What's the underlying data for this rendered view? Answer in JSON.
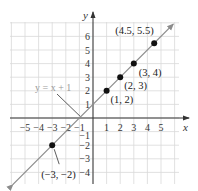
{
  "chart_data": {
    "type": "line",
    "title": "",
    "xlabel": "x",
    "ylabel": "y",
    "xlim": [
      -6,
      6.3
    ],
    "ylim": [
      -4.9,
      7
    ],
    "grid": true,
    "x_ticks": [
      -5,
      -4,
      -3,
      -2,
      -1,
      1,
      2,
      3,
      4,
      5
    ],
    "x_tick_labels": [
      "−5",
      "−4",
      "−3",
      "−2",
      "−1",
      "1",
      "2",
      "3",
      "4",
      "5"
    ],
    "y_ticks": [
      6,
      5,
      4,
      3,
      2,
      1,
      -1,
      -2,
      -3,
      -4
    ],
    "y_tick_labels": [
      "6",
      "5",
      "4",
      "3",
      "2",
      "1",
      "−1",
      "−2",
      "−3",
      "−4"
    ],
    "series": [
      {
        "name": "y = x + 1",
        "equation": "y = x + 1",
        "slope": 1,
        "intercept": 1,
        "color": "#8c8c8c",
        "line_extent_x": [
          -5.9,
          5.9
        ],
        "arrows": "both"
      }
    ],
    "points": [
      {
        "x": 4.5,
        "y": 5.5,
        "label": "(4.5, 5.5)"
      },
      {
        "x": 3,
        "y": 4,
        "label": "(3, 4)"
      },
      {
        "x": 2,
        "y": 3,
        "label": "(2, 3)"
      },
      {
        "x": 1,
        "y": 2,
        "label": "(1, 2)"
      },
      {
        "x": -3,
        "y": -2,
        "label": "(−3, −2)"
      }
    ],
    "annotations": [
      {
        "text": "y = x + 1",
        "points_to": {
          "x": -0.8,
          "y": 0.2
        },
        "color": "#9a9a9a"
      }
    ],
    "colors": {
      "grid": "#d9d9d9",
      "axis": "#333333",
      "line": "#8c8c8c",
      "point": "#111111"
    }
  }
}
